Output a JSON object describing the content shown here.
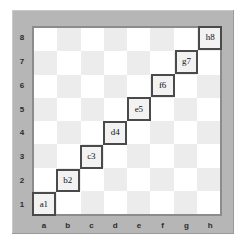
{
  "figure": {
    "board_size": 8,
    "colors": {
      "frame": "#b6b6b6",
      "border": "#8c8c8c",
      "light_square": "#ffffff",
      "dark_square": "#ececec",
      "marker_fill": "#f2f2f2",
      "marker_border": "#4a4a4a",
      "label_text": "#2b2b2b"
    }
  },
  "rank_labels": [
    "8",
    "7",
    "6",
    "5",
    "4",
    "3",
    "2",
    "1"
  ],
  "file_labels": [
    "a",
    "b",
    "c",
    "d",
    "e",
    "f",
    "g",
    "h"
  ],
  "chart_data": {
    "type": "heatmap",
    "xlabel": "",
    "ylabel": "",
    "x": [
      "a",
      "b",
      "c",
      "d",
      "e",
      "f",
      "g",
      "h"
    ],
    "y": [
      "1",
      "2",
      "3",
      "4",
      "5",
      "6",
      "7",
      "8"
    ],
    "grid": true,
    "legend": "none",
    "annotations": [
      {
        "label": "a1",
        "file": "a",
        "rank": "1",
        "col": 0,
        "row": 7
      },
      {
        "label": "b2",
        "file": "b",
        "rank": "2",
        "col": 1,
        "row": 6
      },
      {
        "label": "c3",
        "file": "c",
        "rank": "3",
        "col": 2,
        "row": 5
      },
      {
        "label": "d4",
        "file": "d",
        "rank": "4",
        "col": 3,
        "row": 4
      },
      {
        "label": "e5",
        "file": "e",
        "rank": "5",
        "col": 4,
        "row": 3
      },
      {
        "label": "f6",
        "file": "f",
        "rank": "6",
        "col": 5,
        "row": 2
      },
      {
        "label": "g7",
        "file": "g",
        "rank": "7",
        "col": 6,
        "row": 1
      },
      {
        "label": "h8",
        "file": "h",
        "rank": "8",
        "col": 7,
        "row": 0
      }
    ]
  }
}
